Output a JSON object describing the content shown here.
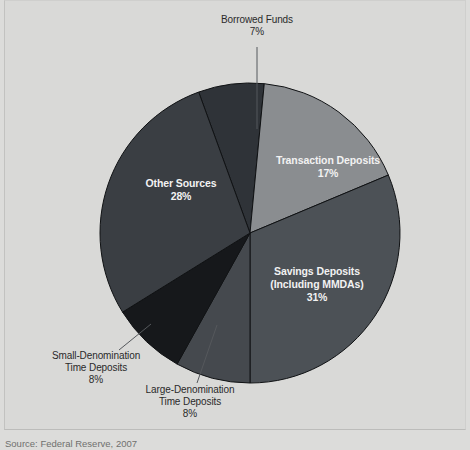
{
  "figure": {
    "background_color": "#d9d9d7",
    "source_note": "Source: Federal Reserve, 2007"
  },
  "chart_data": {
    "type": "pie",
    "title": "",
    "subtitle": "",
    "xlabel": "",
    "ylabel": "",
    "legend_position": "none",
    "grid": false,
    "units": "percent",
    "start_angle_deg": -20,
    "direction": "clockwise",
    "center": {
      "x": 249,
      "y": 232
    },
    "radius": 150,
    "categories": [
      "Borrowed Funds",
      "Transaction Deposits",
      "Savings Deposits (Including MMDAs)",
      "Large-Denomination Time Deposits",
      "Small-Denomination Time Deposits",
      "Other Sources"
    ],
    "values": [
      7,
      17,
      31,
      8,
      8,
      28
    ],
    "total": 99,
    "slices": [
      {
        "key": "borrowed-funds",
        "label": "Borrowed Funds",
        "label_lines": [
          "Borrowed Funds"
        ],
        "value": 7,
        "value_text": "7%",
        "color": "#2f3338",
        "label_placement": "outside",
        "label_x": 256,
        "label_y": 22,
        "leader": {
          "x1": 256,
          "y1": 46,
          "x2": 256,
          "y2": 128
        }
      },
      {
        "key": "transaction-deposits",
        "label": "Transaction Deposits",
        "label_lines": [
          "Transaction Deposits"
        ],
        "value": 17,
        "value_text": "17%",
        "color": "#8a8d90",
        "label_placement": "inside",
        "label_x": 327,
        "label_y": 163
      },
      {
        "key": "savings-deposits",
        "label": "Savings Deposits (Including MMDAs)",
        "label_lines": [
          "Savings Deposits",
          "(Including MMDAs)"
        ],
        "value": 31,
        "value_text": "31%",
        "color": "#4c5156",
        "label_placement": "inside",
        "label_x": 316,
        "label_y": 274
      },
      {
        "key": "large-denomination-time-deposits",
        "label": "Large-Denomination Time Deposits",
        "label_lines": [
          "Large-Denomination",
          "Time Deposits"
        ],
        "value": 8,
        "value_text": "8%",
        "color": "#45494e",
        "label_placement": "outside",
        "label_x": 189,
        "label_y": 392,
        "leader": {
          "x1": 196,
          "y1": 382,
          "x2": 216,
          "y2": 324
        }
      },
      {
        "key": "small-denomination-time-deposits",
        "label": "Small-Denomination Time Deposits",
        "label_lines": [
          "Small-Denomination",
          "Time Deposits"
        ],
        "value": 8,
        "value_text": "8%",
        "color": "#16181b",
        "label_placement": "outside",
        "label_x": 95,
        "label_y": 358,
        "leader": {
          "x1": 118,
          "y1": 349,
          "x2": 150,
          "y2": 323
        }
      },
      {
        "key": "other-sources",
        "label": "Other Sources",
        "label_lines": [
          "Other Sources"
        ],
        "value": 28,
        "value_text": "28%",
        "color": "#3a3e43",
        "label_placement": "inside",
        "label_x": 180,
        "label_y": 186
      }
    ]
  }
}
